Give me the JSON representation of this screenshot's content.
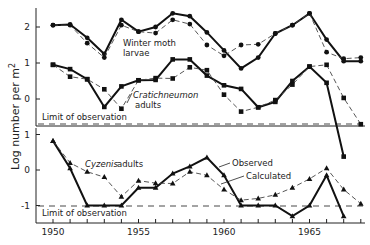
{
  "chart_data": {
    "type": "line",
    "ylabel": "Log number per m²",
    "ylabel_main": "Log number per m",
    "ylabel_sup": "2",
    "x": [
      1950,
      1951,
      1952,
      1953,
      1954,
      1955,
      1956,
      1957,
      1958,
      1959,
      1960,
      1961,
      1962,
      1963,
      1964,
      1965,
      1966,
      1967,
      1968
    ],
    "xticks": [
      1950,
      1955,
      1960,
      1965
    ],
    "xtick_labels": [
      "1950",
      "1955",
      "1960",
      "1965"
    ],
    "panels": [
      {
        "name": "upper",
        "yticks": [
          0,
          1,
          2
        ],
        "ytick_labels": [
          "0",
          "1",
          "2"
        ],
        "limit_of_observation": -0.7,
        "limit_label": "Limit of observation",
        "series": [
          {
            "name": "Winter moth larvae (observed)",
            "style": "solid",
            "marker": "circle",
            "values": [
              2.05,
              2.07,
              1.7,
              1.25,
              2.2,
              1.87,
              2.0,
              2.38,
              2.3,
              1.85,
              1.35,
              0.85,
              1.15,
              1.82,
              2.05,
              2.38,
              1.65,
              1.05,
              1.05
            ]
          },
          {
            "name": "Winter moth larvae (calculated)",
            "style": "dashed",
            "marker": "circle",
            "values": [
              2.05,
              2.05,
              1.55,
              1.15,
              2.05,
              1.87,
              1.83,
              2.2,
              2.08,
              1.5,
              1.2,
              1.5,
              1.52,
              1.82,
              2.05,
              2.38,
              1.3,
              1.12,
              1.15
            ]
          },
          {
            "name": "Cratichneumon adults (observed)",
            "style": "solid",
            "marker": "square",
            "values": [
              0.95,
              0.83,
              0.55,
              -0.22,
              0.35,
              0.52,
              0.53,
              1.1,
              1.1,
              0.65,
              0.38,
              0.28,
              -0.23,
              -0.08,
              0.5,
              0.9,
              0.45,
              -1.6,
              null
            ]
          },
          {
            "name": "Cratichneumon adults (calculated)",
            "style": "dashed",
            "marker": "square",
            "values": [
              0.95,
              0.62,
              0.55,
              0.27,
              -0.27,
              0.52,
              0.58,
              0.57,
              0.88,
              0.8,
              0.12,
              -0.35,
              -0.23,
              -0.03,
              0.4,
              0.9,
              0.95,
              0.03,
              -0.7
            ]
          }
        ],
        "labels": [
          {
            "text": "Winter moth",
            "italic": false
          },
          {
            "text": "larvae",
            "italic": false
          },
          {
            "text": "Cratichneumon",
            "italic": true
          },
          {
            "text": "adults",
            "italic": false
          }
        ]
      },
      {
        "name": "lower",
        "yticks": [
          -1,
          0,
          1
        ],
        "ytick_labels": [
          "-1",
          "0",
          "1"
        ],
        "limit_of_observation": -1.0,
        "limit_label": "Limit of observation",
        "series": [
          {
            "name": "Cyzenis adults (observed)",
            "style": "solid",
            "marker": "triangle",
            "values": [
              0.82,
              0.05,
              -1.0,
              -1.0,
              -1.0,
              -0.5,
              -0.5,
              -0.1,
              0.1,
              0.35,
              -0.15,
              -1.0,
              -1.0,
              -1.0,
              -1.3,
              -1.0,
              -0.15,
              -1.3,
              null
            ]
          },
          {
            "name": "Cyzenis adults (calculated)",
            "style": "dashed",
            "marker": "triangle",
            "values": [
              0.82,
              0.2,
              -0.05,
              -0.2,
              -0.75,
              -0.3,
              -0.37,
              -0.38,
              -0.05,
              -0.15,
              -0.55,
              -0.85,
              -0.8,
              -0.7,
              -0.5,
              -0.25,
              0.05,
              -0.55,
              -0.95
            ]
          }
        ],
        "labels": [
          {
            "text": "Cyzenis",
            "italic": true
          },
          {
            "text": "adults",
            "italic": false
          },
          {
            "text": "Observed",
            "italic": false
          },
          {
            "text": "Calculated",
            "italic": false
          }
        ]
      }
    ]
  }
}
